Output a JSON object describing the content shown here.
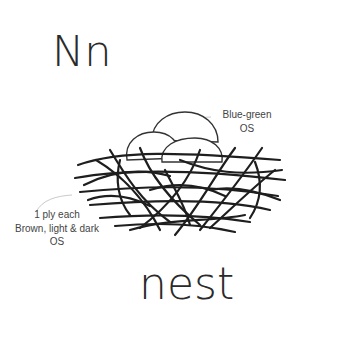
{
  "heading": {
    "letters": "Nn"
  },
  "word": "nest",
  "labels": {
    "eggs": {
      "line1": "Blue-green",
      "line2": "OS"
    },
    "nest": {
      "line1": "1 ply each",
      "line2": "Brown, light & dark",
      "line3": "OS"
    }
  },
  "colors": {
    "ink": "#2a2a2a",
    "strand": "#1e1e1e",
    "leader": "#bbbbbb",
    "background": "#ffffff"
  }
}
